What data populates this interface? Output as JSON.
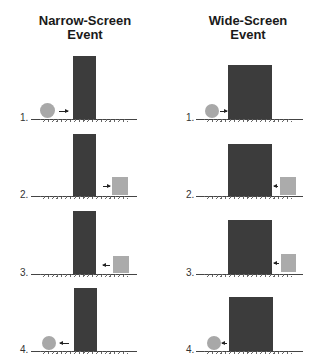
{
  "panels": [
    {
      "title_line1": "Narrow-Screen",
      "title_line2": "Event",
      "screen": "narrow",
      "steps": [
        {
          "label": "1.",
          "object": "ball",
          "position": "left",
          "arrow": "right"
        },
        {
          "label": "2.",
          "object": "box",
          "position": "right",
          "arrow": "right"
        },
        {
          "label": "3.",
          "object": "box",
          "position": "right",
          "arrow": "left"
        },
        {
          "label": "4.",
          "object": "ball",
          "position": "left",
          "arrow": "left"
        }
      ]
    },
    {
      "title_line1": "Wide-Screen",
      "title_line2": "Event",
      "screen": "wide",
      "steps": [
        {
          "label": "1.",
          "object": "ball",
          "position": "left",
          "arrow": "right"
        },
        {
          "label": "2.",
          "object": "box",
          "position": "right",
          "arrow": "left"
        },
        {
          "label": "3.",
          "object": "box",
          "position": "right",
          "arrow": "left"
        },
        {
          "label": "4.",
          "object": "ball",
          "position": "left",
          "arrow": "right"
        }
      ]
    }
  ],
  "colors": {
    "screen": "#3c3c3c",
    "ball": "#a8a8a8",
    "box": "#ababab",
    "ground": "#444444"
  }
}
